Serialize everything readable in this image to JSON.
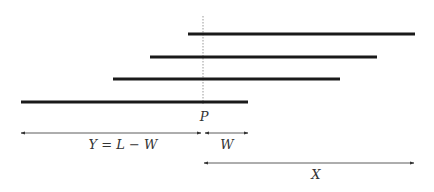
{
  "diagram": {
    "colors": {
      "segment": "#1a1a1a",
      "arrow": "#333333",
      "marker": "#999999",
      "text": "#333333"
    },
    "marker": {
      "x": 203,
      "y1": 16,
      "y2": 104,
      "label": "P",
      "label_x": 204,
      "label_y": 121
    },
    "segments": [
      {
        "x1": 188,
        "x2": 415,
        "y": 34
      },
      {
        "x1": 150,
        "x2": 377,
        "y": 57
      },
      {
        "x1": 113,
        "x2": 340,
        "y": 79
      },
      {
        "x1": 21,
        "x2": 248,
        "y": 102
      }
    ],
    "arrows": [
      {
        "name": "Y",
        "x1": 21,
        "x2": 201,
        "y": 133,
        "label": "Y = L − W",
        "label_x": 123,
        "label_y": 149
      },
      {
        "name": "W",
        "x1": 205,
        "x2": 248,
        "y": 133,
        "label": "W",
        "label_x": 227,
        "label_y": 149
      },
      {
        "name": "X",
        "x1": 204,
        "x2": 414,
        "y": 163,
        "label": "X",
        "label_x": 316,
        "label_y": 179
      }
    ]
  }
}
